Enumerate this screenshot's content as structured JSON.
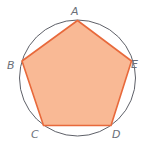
{
  "diagram": {
    "circle": {
      "cx": 77.5,
      "cy": 78,
      "r": 58,
      "stroke": "#5e6068",
      "stroke_width": 1
    },
    "pentagon": {
      "fill": "#F9B995",
      "stroke": "#E8693B",
      "stroke_width": 1.6,
      "vertices": [
        {
          "name": "A",
          "x": 77.5,
          "y": 20.5
        },
        {
          "name": "E",
          "x": 131.5,
          "y": 61
        },
        {
          "name": "D",
          "x": 111,
          "y": 125.5
        },
        {
          "name": "C",
          "x": 43.5,
          "y": 125.5
        },
        {
          "name": "B",
          "x": 22,
          "y": 61
        }
      ]
    },
    "labels": [
      {
        "id": "A",
        "text": "A",
        "x": 71,
        "y": 15
      },
      {
        "id": "B",
        "text": "B",
        "x": 7,
        "y": 69
      },
      {
        "id": "E",
        "text": "E",
        "x": 131,
        "y": 68
      },
      {
        "id": "C",
        "text": "C",
        "x": 31,
        "y": 138
      },
      {
        "id": "D",
        "text": "D",
        "x": 112,
        "y": 138
      }
    ]
  }
}
